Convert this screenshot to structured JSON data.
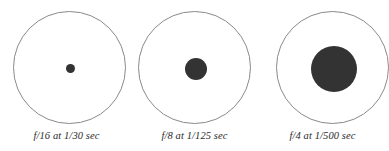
{
  "figure": {
    "background_color": "#ffffff",
    "lens_stroke_color": "#8a8a8a",
    "aperture_fill_color": "#333333",
    "caption_color": "#2a2a2a"
  },
  "chart_data": {
    "type": "diagram",
    "categories": [
      "f/16 at 1/30 sec",
      "f/8 at 1/125 sec",
      "f/4 at 1/500 sec"
    ],
    "values": [
      9,
      22,
      46
    ],
    "ylabel": "Aperture opening diameter (px)",
    "xlabel": "",
    "series": [
      {
        "name": "aperture_diameter_px",
        "values": [
          9,
          22,
          46
        ]
      },
      {
        "name": "lens_circle_diameter_px",
        "values": [
          113,
          113,
          113
        ]
      }
    ],
    "annotations": [
      "f/16 at 1/30 sec",
      "f/8 at 1/125 sec",
      "f/4 at 1/500 sec"
    ],
    "grid": false,
    "legend": "none"
  },
  "groups": [
    {
      "id": "group-1",
      "aperture_label": "f/16",
      "shutter_label": "1/30 sec",
      "caption": "f/16 at 1/30 sec"
    },
    {
      "id": "group-2",
      "aperture_label": "f/8",
      "shutter_label": "1/125 sec",
      "caption": "f/8 at 1/125 sec"
    },
    {
      "id": "group-3",
      "aperture_label": "f/4",
      "shutter_label": "1/500 sec",
      "caption": "f/4 at 1/500 sec"
    }
  ]
}
